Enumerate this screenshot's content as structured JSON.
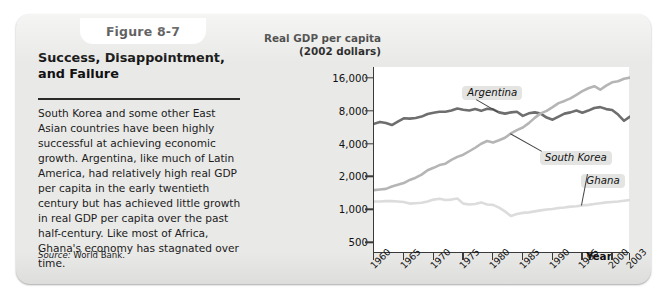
{
  "figure": {
    "tab_label": "Figure 8-7",
    "title": "Success, Disappointment, and Failure",
    "body": "South Korea and some other East Asian countries have been highly successful at achieving economic growth. Argentina, like much of Latin America, had relatively high real GDP per capita in the early twentieth century but has achieved little growth in real GDP per capita over the past half-century. Like most of Africa, Ghana's economy has stagnated over time.",
    "source_label": "Source:",
    "source_value": "World Bank."
  },
  "chart_data": {
    "type": "line",
    "title": "",
    "ylabel": "Real GDP per capita (2002 dollars)",
    "xlabel": "Year",
    "yscale": "log",
    "ylim": [
      400,
      20000
    ],
    "xlim": [
      1960,
      2003
    ],
    "grid": false,
    "legend_position": "inline-annotations",
    "ytick_labels": [
      "16,000",
      "8,000",
      "4,000",
      "2,000",
      "1,000",
      "500"
    ],
    "ytick_values": [
      16000,
      8000,
      4000,
      2000,
      1000,
      500
    ],
    "xtick_labels": [
      "1960",
      "1965",
      "1970",
      "1975",
      "1980",
      "1985",
      "1990",
      "1995",
      "2000",
      "2003"
    ],
    "xtick_values": [
      1960,
      1965,
      1970,
      1975,
      1980,
      1985,
      1990,
      1995,
      2000,
      2003
    ],
    "series": [
      {
        "name": "Argentina",
        "color": "#6e6e6e",
        "x": [
          1960,
          1961,
          1962,
          1963,
          1964,
          1965,
          1966,
          1967,
          1968,
          1969,
          1970,
          1971,
          1972,
          1973,
          1974,
          1975,
          1976,
          1977,
          1978,
          1979,
          1980,
          1981,
          1982,
          1983,
          1984,
          1985,
          1986,
          1987,
          1988,
          1989,
          1990,
          1991,
          1992,
          1993,
          1994,
          1995,
          1996,
          1997,
          1998,
          1999,
          2000,
          2001,
          2002,
          2003
        ],
        "values": [
          6050,
          6300,
          6150,
          5900,
          6350,
          6800,
          6750,
          6850,
          7050,
          7450,
          7650,
          7800,
          7800,
          8000,
          8350,
          8150,
          8000,
          8250,
          7950,
          8300,
          8200,
          7700,
          7500,
          7700,
          7800,
          7150,
          7550,
          7700,
          7500,
          6900,
          6600,
          7050,
          7500,
          7700,
          8000,
          7650,
          8000,
          8450,
          8600,
          8250,
          8100,
          7350,
          6450,
          7050
        ]
      },
      {
        "name": "South Korea",
        "color": "#b5b5b5",
        "x": [
          1960,
          1961,
          1962,
          1963,
          1964,
          1965,
          1966,
          1967,
          1968,
          1969,
          1970,
          1971,
          1972,
          1973,
          1974,
          1975,
          1976,
          1977,
          1978,
          1979,
          1980,
          1981,
          1982,
          1983,
          1984,
          1985,
          1986,
          1987,
          1988,
          1989,
          1990,
          1991,
          1992,
          1993,
          1994,
          1995,
          1996,
          1997,
          1998,
          1999,
          2000,
          2001,
          2002,
          2003
        ],
        "values": [
          1500,
          1520,
          1540,
          1620,
          1680,
          1740,
          1860,
          1950,
          2080,
          2280,
          2400,
          2540,
          2620,
          2830,
          3020,
          3160,
          3400,
          3660,
          3980,
          4220,
          4080,
          4280,
          4520,
          4950,
          5300,
          5600,
          6140,
          6860,
          7540,
          7950,
          8600,
          9350,
          9800,
          10350,
          11150,
          12050,
          12800,
          13350,
          12400,
          13500,
          14500,
          14800,
          15600,
          16000
        ]
      },
      {
        "name": "Ghana",
        "color": "#dcdcdc",
        "x": [
          1960,
          1961,
          1962,
          1963,
          1964,
          1965,
          1966,
          1967,
          1968,
          1969,
          1970,
          1971,
          1972,
          1973,
          1974,
          1975,
          1976,
          1977,
          1978,
          1979,
          1980,
          1981,
          1982,
          1983,
          1984,
          1985,
          1986,
          1987,
          1988,
          1989,
          1990,
          1991,
          1992,
          1993,
          1994,
          1995,
          1996,
          1997,
          1998,
          1999,
          2000,
          2001,
          2002,
          2003
        ],
        "values": [
          1180,
          1180,
          1190,
          1190,
          1180,
          1170,
          1130,
          1140,
          1150,
          1180,
          1230,
          1250,
          1220,
          1230,
          1260,
          1130,
          1110,
          1120,
          1160,
          1110,
          1100,
          1040,
          960,
          870,
          910,
          930,
          940,
          960,
          980,
          1000,
          1010,
          1030,
          1040,
          1060,
          1070,
          1090,
          1100,
          1120,
          1140,
          1160,
          1170,
          1180,
          1200,
          1220
        ]
      }
    ],
    "annotations": [
      {
        "text": "Argentina",
        "x": 1975,
        "y": 13500
      },
      {
        "text": "South Korea",
        "x": 1988,
        "y": 3400
      },
      {
        "text": "Ghana",
        "x": 1995,
        "y": 2100
      }
    ]
  }
}
